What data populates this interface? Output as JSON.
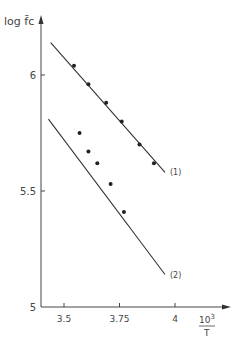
{
  "chart_data": {
    "type": "scatter",
    "title": "",
    "ylabel": "log f̄c",
    "xlabel": "10³/T",
    "xlabel_num": "10",
    "xlabel_sup": "3",
    "xlabel_den": "T",
    "xlim": [
      3.4,
      4.05
    ],
    "ylim": [
      5.0,
      6.3
    ],
    "x_ticks": [
      {
        "value": 3.5,
        "label": "3.5"
      },
      {
        "value": 3.75,
        "label": "3.75"
      },
      {
        "value": 4.0,
        "label": "4"
      }
    ],
    "y_ticks": [
      {
        "value": 5.0,
        "label": "5"
      },
      {
        "value": 5.5,
        "label": "5.5"
      },
      {
        "value": 6.0,
        "label": "6"
      }
    ],
    "grid": false,
    "legend": "inline line labels",
    "series": [
      {
        "name": "(1)",
        "points": [
          {
            "x": 3.545,
            "y": 6.04
          },
          {
            "x": 3.61,
            "y": 5.96
          },
          {
            "x": 3.69,
            "y": 5.88
          },
          {
            "x": 3.76,
            "y": 5.8
          },
          {
            "x": 3.84,
            "y": 5.7
          },
          {
            "x": 3.905,
            "y": 5.62
          }
        ],
        "fit_line": {
          "x0": 3.44,
          "y0": 6.14,
          "x1": 3.955,
          "y1": 5.58
        }
      },
      {
        "name": "(2)",
        "points": [
          {
            "x": 3.57,
            "y": 5.75
          },
          {
            "x": 3.61,
            "y": 5.67
          },
          {
            "x": 3.65,
            "y": 5.62
          },
          {
            "x": 3.71,
            "y": 5.53
          },
          {
            "x": 3.77,
            "y": 5.41
          }
        ],
        "fit_line": {
          "x0": 3.43,
          "y0": 5.81,
          "x1": 3.955,
          "y1": 5.14
        }
      }
    ]
  }
}
